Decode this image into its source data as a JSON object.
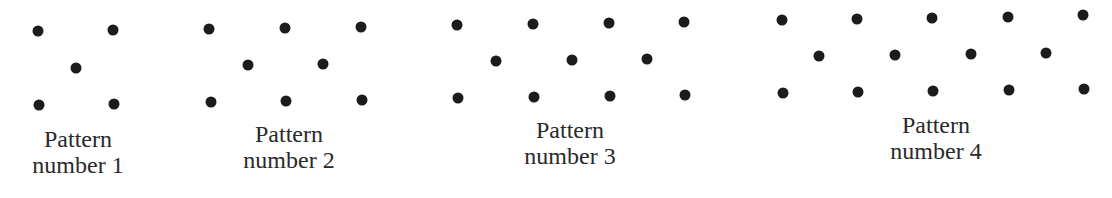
{
  "figure": {
    "background": "#ffffff",
    "dot_color": "#1c1c1c",
    "text_color": "#2a2a2a",
    "patterns": [
      {
        "number": 1,
        "label_line1": "Pattern",
        "label_line2": "number 1",
        "label_center": [
          78,
          126
        ],
        "dots": [
          [
            38,
            31
          ],
          [
            113,
            30
          ],
          [
            76,
            68
          ],
          [
            39,
            105
          ],
          [
            114,
            104
          ]
        ]
      },
      {
        "number": 2,
        "label_line1": "Pattern",
        "label_line2": "number 2",
        "label_center": [
          289,
          121
        ],
        "dots": [
          [
            209,
            29
          ],
          [
            285,
            28
          ],
          [
            361,
            27
          ],
          [
            248,
            65
          ],
          [
            323,
            64
          ],
          [
            211,
            102
          ],
          [
            286,
            101
          ],
          [
            362,
            100
          ]
        ]
      },
      {
        "number": 3,
        "label_line1": "Pattern",
        "label_line2": "number 3",
        "label_center": [
          570,
          117
        ],
        "dots": [
          [
            457,
            25
          ],
          [
            533,
            24
          ],
          [
            609,
            23
          ],
          [
            684,
            22
          ],
          [
            496,
            61
          ],
          [
            572,
            60
          ],
          [
            647,
            59
          ],
          [
            458,
            98
          ],
          [
            534,
            97
          ],
          [
            610,
            96
          ],
          [
            685,
            95
          ]
        ]
      },
      {
        "number": 4,
        "label_line1": "Pattern",
        "label_line2": "number 4",
        "label_center": [
          936,
          112
        ],
        "dots": [
          [
            782,
            20
          ],
          [
            857,
            19
          ],
          [
            932,
            18
          ],
          [
            1008,
            17
          ],
          [
            1083,
            15
          ],
          [
            819,
            56
          ],
          [
            895,
            55
          ],
          [
            971,
            54
          ],
          [
            1046,
            53
          ],
          [
            783,
            93
          ],
          [
            858,
            92
          ],
          [
            933,
            91
          ],
          [
            1009,
            90
          ],
          [
            1084,
            89
          ]
        ]
      }
    ]
  }
}
